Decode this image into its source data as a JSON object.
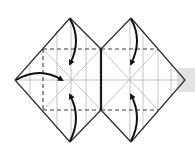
{
  "diagram": {
    "type": "origami-fold-diagram",
    "colors": {
      "edge": "#2a2a2a",
      "crease": "#b4b4b4",
      "valley_fold": "#3a3a3a",
      "arrow": "#111111",
      "side_tab": "#e2e2e2"
    },
    "units": [
      {
        "name": "left-diamond",
        "center": [
          71,
          80
        ],
        "vertices": {
          "top": [
            70,
            18
          ],
          "left": [
            15,
            80
          ],
          "bottom": [
            70,
            142
          ],
          "right": [
            101,
            80
          ]
        },
        "arrows": [
          "top-corner-to-center",
          "left-corner-to-center",
          "bottom-corner-to-center"
        ]
      },
      {
        "name": "right-diamond",
        "center": [
          130,
          80
        ],
        "vertices": {
          "top": [
            131,
            18
          ],
          "left": [
            101,
            80
          ],
          "bottom": [
            131,
            142
          ],
          "right": [
            185,
            80
          ]
        },
        "arrows": [
          "top-corner-to-center",
          "bottom-corner-to-center"
        ]
      }
    ],
    "shared_edge": {
      "x": 101,
      "y1": 49,
      "y2": 110
    },
    "valley_lines": {
      "top_y": 49,
      "bottom_y": 110,
      "left_x": 43
    }
  }
}
